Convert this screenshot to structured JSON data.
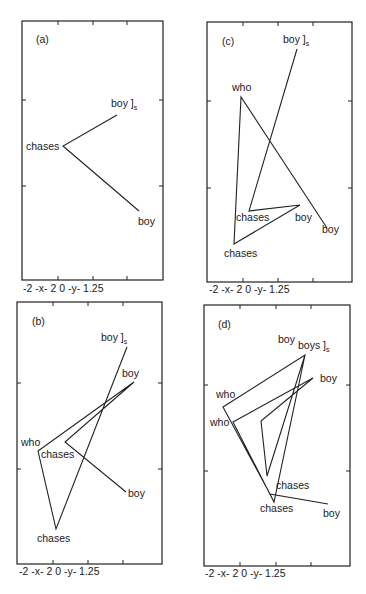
{
  "panels": [
    {
      "id": "a",
      "label": "(a)",
      "axis_caption": "-2 -x- 2 0 -y- 1.25",
      "words": [
        {
          "text": "boy ]",
          "sub": "s",
          "role": "end"
        },
        {
          "text": "chases"
        },
        {
          "text": "boy"
        }
      ]
    },
    {
      "id": "b",
      "label": "(b)",
      "axis_caption": "-2 -x- 2 0 -y- 1.25",
      "words": [
        {
          "text": "boy ]",
          "sub": "s",
          "role": "end"
        },
        {
          "text": "boy"
        },
        {
          "text": "who"
        },
        {
          "text": "chases"
        },
        {
          "text": "boy"
        },
        {
          "text": "chases"
        }
      ]
    },
    {
      "id": "c",
      "label": "(c)",
      "axis_caption": "-2 -x- 2 0 -y- 1.25",
      "words": [
        {
          "text": "boy ]",
          "sub": "s",
          "role": "end"
        },
        {
          "text": "who"
        },
        {
          "text": "chases"
        },
        {
          "text": "boy"
        },
        {
          "text": "boy"
        },
        {
          "text": "chases"
        }
      ]
    },
    {
      "id": "d",
      "label": "(d)",
      "axis_caption": "-2 -x- 2 0 -y- 1.25",
      "words": [
        {
          "text": "boy"
        },
        {
          "text": "boys ]",
          "sub": "s",
          "role": "end"
        },
        {
          "text": "boy"
        },
        {
          "text": "who"
        },
        {
          "text": "who"
        },
        {
          "text": "chases"
        },
        {
          "text": "chases"
        },
        {
          "text": "boy"
        }
      ]
    }
  ],
  "axes": {
    "x_range": [
      -2,
      2
    ],
    "y_range": [
      0,
      1.25
    ],
    "x_label": "x",
    "y_label": "y"
  }
}
